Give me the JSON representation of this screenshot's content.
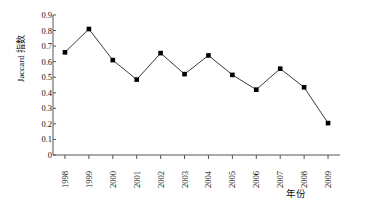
{
  "chart_data": {
    "type": "line",
    "title": "",
    "xlabel": "年份",
    "ylabel": "Jaccard 指数",
    "categories": [
      "1998",
      "1999",
      "2000",
      "2001",
      "2002",
      "2003",
      "2004",
      "2005",
      "2006",
      "2007",
      "2008",
      "2009"
    ],
    "values": [
      0.66,
      0.81,
      0.61,
      0.485,
      0.655,
      0.52,
      0.64,
      0.515,
      0.42,
      0.555,
      0.435,
      0.205
    ],
    "series": [
      {
        "name": "Jaccard 指数",
        "values": [
          0.66,
          0.81,
          0.61,
          0.485,
          0.655,
          0.52,
          0.64,
          0.515,
          0.42,
          0.555,
          0.435,
          0.205
        ]
      }
    ],
    "ylim": [
      0,
      0.9
    ],
    "yticks": [
      "0",
      "0.1",
      "0.2",
      "0.3",
      "0.4",
      "0.5",
      "0.6",
      "0.7",
      "0.8",
      "0.9"
    ],
    "ytick_values": [
      0,
      0.1,
      0.2,
      0.3,
      0.4,
      0.5,
      0.6,
      0.7,
      0.8,
      0.9
    ],
    "grid": false,
    "legend": "none",
    "marker": "filled-square",
    "line_color": "#3a3a3a",
    "marker_color": "#000000",
    "axis_color": "#555555",
    "background": "#ffffff"
  }
}
